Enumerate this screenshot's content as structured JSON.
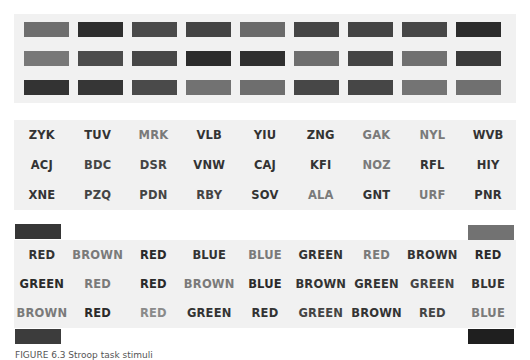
{
  "bars_panel": {
    "rows": [
      [
        "#6e6e6e",
        "#2e2e2e",
        "#4a4a4a",
        "#444444",
        "#6a6a6a",
        "#454545",
        "#444444",
        "#474747",
        "#2c2c2c"
      ],
      [
        "#787878",
        "#4c4c4c",
        "#474747",
        "#2c2c2c",
        "#2f2f2f",
        "#6e6e6e",
        "#454545",
        "#707070",
        "#3a3a3a"
      ],
      [
        "#333333",
        "#363636",
        "#4a4a4a",
        "#727272",
        "#6e6e6e",
        "#474747",
        "#464646",
        "#747474",
        "#707070"
      ]
    ]
  },
  "letters_panel": {
    "rows": [
      [
        {
          "text": "ZYK",
          "color": "#333333"
        },
        {
          "text": "TUV",
          "color": "#333333"
        },
        {
          "text": "MRK",
          "color": "#7a7a7a"
        },
        {
          "text": "VLB",
          "color": "#333333"
        },
        {
          "text": "YIU",
          "color": "#333333"
        },
        {
          "text": "ZNG",
          "color": "#333333"
        },
        {
          "text": "GAK",
          "color": "#7a7a7a"
        },
        {
          "text": "NYL",
          "color": "#7a7a7a"
        },
        {
          "text": "WVB",
          "color": "#333333"
        }
      ],
      [
        {
          "text": "ACJ",
          "color": "#333333"
        },
        {
          "text": "BDC",
          "color": "#444444"
        },
        {
          "text": "DSR",
          "color": "#444444"
        },
        {
          "text": "VNW",
          "color": "#333333"
        },
        {
          "text": "CAJ",
          "color": "#333333"
        },
        {
          "text": "KFI",
          "color": "#333333"
        },
        {
          "text": "NOZ",
          "color": "#7a7a7a"
        },
        {
          "text": "RFL",
          "color": "#333333"
        },
        {
          "text": "HIY",
          "color": "#333333"
        }
      ],
      [
        {
          "text": "XNE",
          "color": "#333333"
        },
        {
          "text": "PZQ",
          "color": "#444444"
        },
        {
          "text": "PDN",
          "color": "#444444"
        },
        {
          "text": "RBY",
          "color": "#444444"
        },
        {
          "text": "SOV",
          "color": "#333333"
        },
        {
          "text": "ALA",
          "color": "#7a7a7a"
        },
        {
          "text": "GNT",
          "color": "#333333"
        },
        {
          "text": "URF",
          "color": "#7a7a7a"
        },
        {
          "text": "PNR",
          "color": "#333333"
        }
      ]
    ]
  },
  "words_panel": {
    "rows": [
      [
        {
          "text": "RED",
          "color": "#333333"
        },
        {
          "text": "BROWN",
          "color": "#7a7a7a"
        },
        {
          "text": "RED",
          "color": "#2a2a2a"
        },
        {
          "text": "BLUE",
          "color": "#333333"
        },
        {
          "text": "BLUE",
          "color": "#7a7a7a"
        },
        {
          "text": "GREEN",
          "color": "#333333"
        },
        {
          "text": "RED",
          "color": "#7a7a7a"
        },
        {
          "text": "BROWN",
          "color": "#333333"
        },
        {
          "text": "RED",
          "color": "#2a2a2a"
        }
      ],
      [
        {
          "text": "GREEN",
          "color": "#2a2a2a"
        },
        {
          "text": "RED",
          "color": "#7a7a7a"
        },
        {
          "text": "RED",
          "color": "#2a2a2a"
        },
        {
          "text": "BROWN",
          "color": "#7a7a7a"
        },
        {
          "text": "BLUE",
          "color": "#2a2a2a"
        },
        {
          "text": "BROWN",
          "color": "#333333"
        },
        {
          "text": "GREEN",
          "color": "#333333"
        },
        {
          "text": "GREEN",
          "color": "#444444"
        },
        {
          "text": "BLUE",
          "color": "#333333"
        }
      ],
      [
        {
          "text": "BROWN",
          "color": "#7a7a7a"
        },
        {
          "text": "RED",
          "color": "#2a2a2a"
        },
        {
          "text": "RED",
          "color": "#8a8a8a"
        },
        {
          "text": "GREEN",
          "color": "#333333"
        },
        {
          "text": "RED",
          "color": "#333333"
        },
        {
          "text": "GREEN",
          "color": "#444444"
        },
        {
          "text": "BROWN",
          "color": "#333333"
        },
        {
          "text": "RED",
          "color": "#444444"
        },
        {
          "text": "BLUE",
          "color": "#7a7a7a"
        }
      ]
    ],
    "corner_bars": {
      "top_left": "#363636",
      "top_right": "#727272",
      "bottom_left": "#3c3c3c",
      "bottom_right": "#1f1f1f"
    }
  },
  "caption": {
    "text": "FIGURE 6.3 Stroop task stimuli"
  }
}
